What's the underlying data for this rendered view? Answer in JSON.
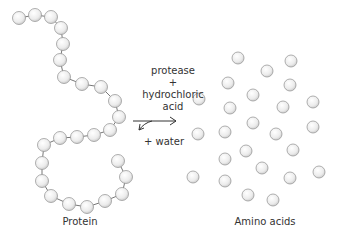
{
  "reaction": {
    "enzyme": "protease",
    "plus": "+",
    "acid_line1": "hydrochloric",
    "acid_line2": "acid",
    "water": "+ water"
  },
  "labels": {
    "protein": "Protein",
    "amino_acids": "Amino acids"
  },
  "colors": {
    "bead_fill": "#f2f2f2",
    "bead_stroke": "#9a9a9a",
    "chain_line": "#777777",
    "text": "#333333"
  },
  "protein_bead_count": 31,
  "amino_acid_count": 27
}
